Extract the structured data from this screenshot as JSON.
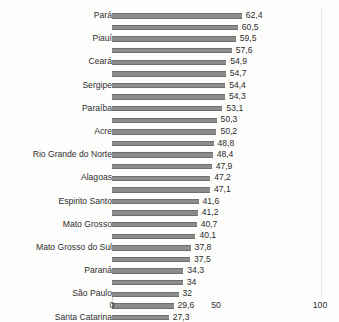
{
  "chart_data": {
    "type": "bar",
    "orientation": "horizontal",
    "title": "",
    "xlabel": "",
    "ylabel": "",
    "xlim": [
      0,
      100
    ],
    "xticks": [
      "0",
      "50",
      "100"
    ],
    "grid": false,
    "legend": false,
    "decimal_separator": ",",
    "note": "Category labels are printed on alternating rows only; unlabeled rows show an empty label in the source image.",
    "bars": [
      {
        "label": "Pará",
        "value": 62.4,
        "value_text": "62,4"
      },
      {
        "label": "",
        "value": 60.5,
        "value_text": "60,5"
      },
      {
        "label": "Piauí",
        "value": 59.5,
        "value_text": "59,5"
      },
      {
        "label": "",
        "value": 57.6,
        "value_text": "57,6"
      },
      {
        "label": "Ceará",
        "value": 54.9,
        "value_text": "54,9"
      },
      {
        "label": "",
        "value": 54.7,
        "value_text": "54,7"
      },
      {
        "label": "Sergipe",
        "value": 54.4,
        "value_text": "54,4"
      },
      {
        "label": "",
        "value": 54.3,
        "value_text": "54,3"
      },
      {
        "label": "Paraíba",
        "value": 53.1,
        "value_text": "53,1"
      },
      {
        "label": "",
        "value": 50.3,
        "value_text": "50,3"
      },
      {
        "label": "Acre",
        "value": 50.2,
        "value_text": "50,2"
      },
      {
        "label": "",
        "value": 48.8,
        "value_text": "48,8"
      },
      {
        "label": "Rio Grande do Norte",
        "value": 48.4,
        "value_text": "48,4"
      },
      {
        "label": "",
        "value": 47.9,
        "value_text": "47,9"
      },
      {
        "label": "Alagoas",
        "value": 47.2,
        "value_text": "47,2"
      },
      {
        "label": "",
        "value": 47.1,
        "value_text": "47,1"
      },
      {
        "label": "Espirito Santo",
        "value": 41.6,
        "value_text": "41,6"
      },
      {
        "label": "",
        "value": 41.2,
        "value_text": "41,2"
      },
      {
        "label": "Mato Grosso",
        "value": 40.7,
        "value_text": "40,7"
      },
      {
        "label": "",
        "value": 40.1,
        "value_text": "40,1"
      },
      {
        "label": "Mato Grosso do Sul",
        "value": 37.8,
        "value_text": "37,8"
      },
      {
        "label": "",
        "value": 37.5,
        "value_text": "37,5"
      },
      {
        "label": "Paraná",
        "value": 34.3,
        "value_text": "34,3"
      },
      {
        "label": "",
        "value": 34.0,
        "value_text": "34"
      },
      {
        "label": "São Paulo",
        "value": 32.0,
        "value_text": "32"
      },
      {
        "label": "",
        "value": 29.6,
        "value_text": "29,6"
      },
      {
        "label": "Santa Catarina",
        "value": 27.3,
        "value_text": "27,3"
      }
    ],
    "colors": {
      "bar_fill": "#8c8c8c",
      "bar_edge": "#6e6e6e",
      "text": "#2b2b2b",
      "background": "#fdfdfc",
      "frame": "#e8e8e8"
    }
  }
}
